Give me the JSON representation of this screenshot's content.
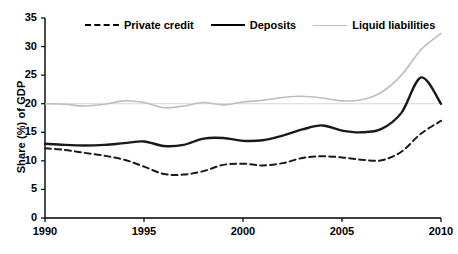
{
  "chart_data": {
    "type": "line",
    "title": "",
    "xlabel": "",
    "ylabel": "Share (%) of GDP",
    "xlim": [
      1990,
      2010
    ],
    "ylim": [
      0,
      35
    ],
    "ytick_values": [
      0,
      5,
      10,
      15,
      20,
      25,
      30,
      35
    ],
    "ytick_labels": [
      "0",
      "5",
      "10",
      "15",
      "20",
      "25",
      "30",
      "35"
    ],
    "xtick_values": [
      1990,
      1995,
      2000,
      2005,
      2010
    ],
    "xtick_labels": [
      "1990",
      "1995",
      "2000",
      "2005",
      "2010"
    ],
    "grid": false,
    "legend_position": "top",
    "x": [
      1990,
      1991,
      1992,
      1993,
      1994,
      1995,
      1996,
      1997,
      1998,
      1999,
      2000,
      2001,
      2002,
      2003,
      2004,
      2005,
      2006,
      2007,
      2008,
      2009,
      2010
    ],
    "series": [
      {
        "name": "Private credit",
        "style": "dashed",
        "color": "#1a1a1a",
        "width": 2,
        "values": [
          12.2,
          11.9,
          11.4,
          10.9,
          10.2,
          9.0,
          7.7,
          7.6,
          8.2,
          9.3,
          9.5,
          9.2,
          9.6,
          10.5,
          10.8,
          10.6,
          10.2,
          10.1,
          11.6,
          14.8,
          17.0
        ]
      },
      {
        "name": "Deposits",
        "style": "solid",
        "color": "#1a1a1a",
        "width": 2.4,
        "values": [
          13.0,
          12.8,
          12.7,
          12.8,
          13.1,
          13.4,
          12.6,
          12.8,
          13.9,
          14.0,
          13.5,
          13.6,
          14.4,
          15.5,
          16.2,
          15.3,
          15.0,
          15.6,
          18.4,
          24.6,
          20.0
        ]
      },
      {
        "name": "Liquid liabilities",
        "style": "solid",
        "color": "#bdbdbd",
        "width": 1.6,
        "values": [
          20.0,
          19.9,
          19.6,
          19.9,
          20.5,
          20.2,
          19.3,
          19.6,
          20.2,
          19.8,
          20.3,
          20.6,
          21.1,
          21.3,
          21.0,
          20.5,
          20.7,
          22.0,
          25.0,
          29.5,
          32.3
        ]
      }
    ]
  },
  "legend": {
    "items": [
      {
        "label": "Private credit"
      },
      {
        "label": "Deposits"
      },
      {
        "label": "Liquid liabilities"
      }
    ]
  }
}
